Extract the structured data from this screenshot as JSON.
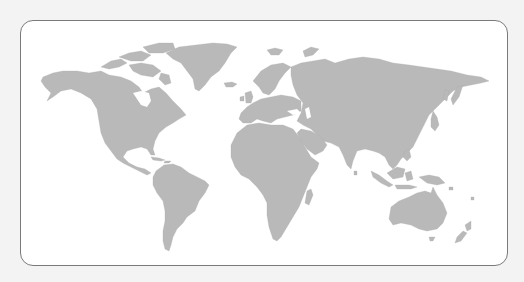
{
  "map": {
    "type": "world-map",
    "projection": "equirectangular-like",
    "style": "gray silhouette with country borders",
    "colors": {
      "background": "#f3f3f3",
      "panel": "#ffffff",
      "border": "#7a7a7a",
      "land": "#b9b9b9"
    },
    "regions": [
      {
        "id": "north-america",
        "label": "North America"
      },
      {
        "id": "greenland",
        "label": "Greenland"
      },
      {
        "id": "south-america",
        "label": "South America"
      },
      {
        "id": "europe",
        "label": "Europe"
      },
      {
        "id": "asia",
        "label": "Asia"
      },
      {
        "id": "africa",
        "label": "Africa"
      },
      {
        "id": "oceania",
        "label": "Oceania"
      }
    ]
  }
}
